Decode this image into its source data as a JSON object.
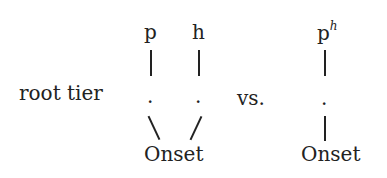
{
  "diagram": {
    "label": "root tier",
    "separator": "vs.",
    "left": {
      "segments": [
        "p",
        "h"
      ],
      "dots": [
        ".",
        "."
      ],
      "node": "Onset"
    },
    "right": {
      "segment_base": "p",
      "segment_superscript": "h",
      "dot": ".",
      "node": "Onset"
    }
  }
}
